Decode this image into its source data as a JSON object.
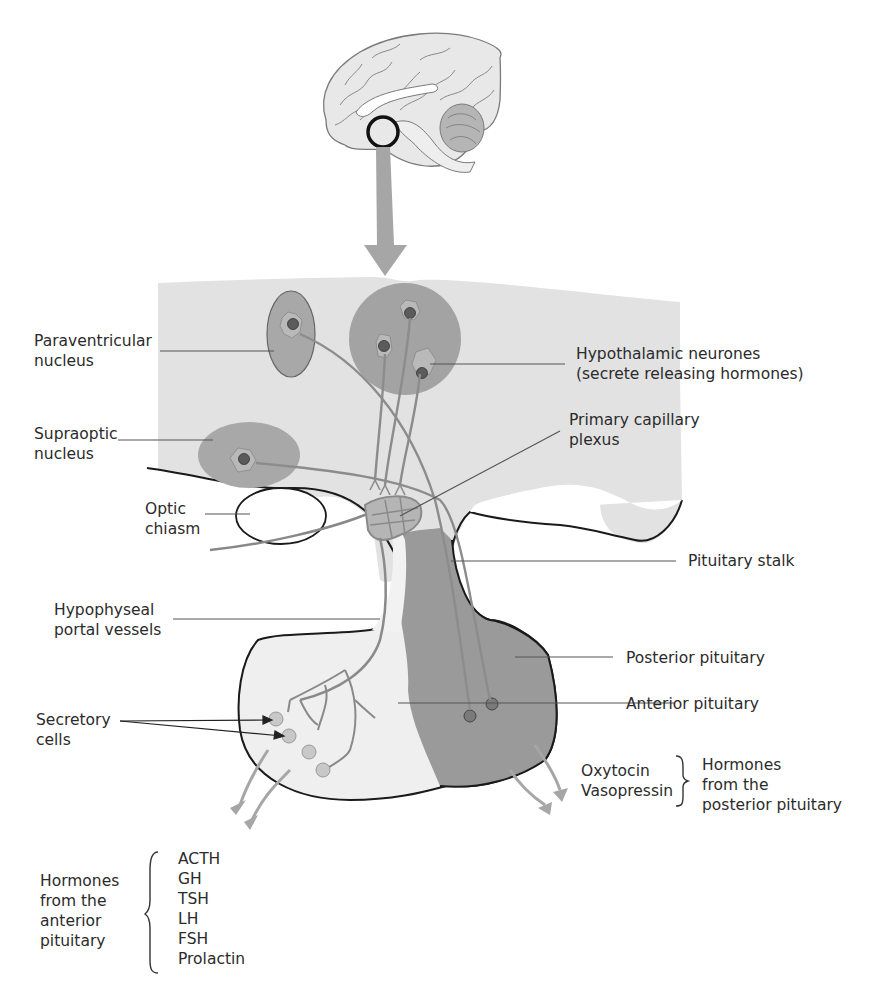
{
  "colors": {
    "hypothalamus_fill": "#e2e2e2",
    "nucleus_fill": "#a8a8a8",
    "neurone_cluster_fill": "#a3a3a3",
    "posterior_pituitary_fill": "#9a9a9a",
    "anterior_pituitary_fill": "#efefef",
    "arrow_gray": "#a6a6a6",
    "outline": "#1a1a1a",
    "leader_line": "#555555"
  },
  "labels": {
    "paraventricular": [
      "Paraventricular",
      "nucleus"
    ],
    "supraoptic": [
      "Supraoptic",
      "nucleus"
    ],
    "optic_chiasm": [
      "Optic",
      "chiasm"
    ],
    "hypothalamic_neurones": [
      "Hypothalamic neurones",
      "(secrete releasing hormones)"
    ],
    "primary_capillary_plexus": [
      "Primary capillary",
      "plexus"
    ],
    "pituitary_stalk": "Pituitary stalk",
    "hypophyseal_portal_vessels": [
      "Hypophyseal",
      "portal vessels"
    ],
    "posterior_pituitary": "Posterior pituitary",
    "anterior_pituitary": "Anterior pituitary",
    "secretory_cells": [
      "Secretory",
      "cells"
    ]
  },
  "posterior_hormones": {
    "items": [
      "Oxytocin",
      "Vasopressin"
    ],
    "group_label": [
      "Hormones",
      "from the",
      "posterior pituitary"
    ]
  },
  "anterior_hormones": {
    "group_label": [
      "Hormones",
      "from the",
      "anterior",
      "pituitary"
    ],
    "items": [
      "ACTH",
      "GH",
      "TSH",
      "LH",
      "FSH",
      "Prolactin"
    ]
  }
}
